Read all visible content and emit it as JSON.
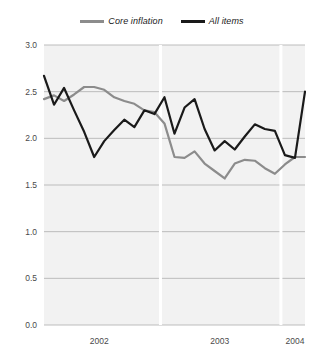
{
  "chart_data": {
    "type": "line",
    "title": "",
    "xlabel": "",
    "ylabel": "",
    "ylim": [
      0.0,
      3.0
    ],
    "ytick_labels": [
      "0.0",
      "0.5",
      "1.0",
      "1.5",
      "2.0",
      "2.5",
      "3.0"
    ],
    "yticks": [
      0.0,
      0.5,
      1.0,
      1.5,
      2.0,
      2.5,
      3.0
    ],
    "xtick_labels": [
      "2002",
      "2003",
      "2004"
    ],
    "xticks": [
      2002,
      2003,
      2004
    ],
    "grid": true,
    "legend_position": "top-center",
    "x": [
      "2002-01",
      "2002-02",
      "2002-03",
      "2002-04",
      "2002-05",
      "2002-06",
      "2002-07",
      "2002-08",
      "2002-09",
      "2002-10",
      "2002-11",
      "2002-12",
      "2003-01",
      "2003-02",
      "2003-03",
      "2003-04",
      "2003-05",
      "2003-06",
      "2003-07",
      "2003-08",
      "2003-09",
      "2003-10",
      "2003-11",
      "2003-12",
      "2004-01",
      "2004-02",
      "2004-03"
    ],
    "series": [
      {
        "name": "Core inflation",
        "color": "#8c8c8c",
        "values": [
          2.42,
          2.46,
          2.4,
          2.47,
          2.55,
          2.55,
          2.52,
          2.44,
          2.4,
          2.37,
          2.3,
          2.28,
          2.16,
          1.8,
          1.79,
          1.86,
          1.73,
          1.65,
          1.57,
          1.73,
          1.77,
          1.76,
          1.68,
          1.62,
          1.72,
          1.8,
          1.8
        ]
      },
      {
        "name": "All items",
        "color": "#1a1a1a",
        "values": [
          2.67,
          2.36,
          2.54,
          2.3,
          2.07,
          1.8,
          1.97,
          2.09,
          2.2,
          2.12,
          2.3,
          2.26,
          2.44,
          2.05,
          2.33,
          2.42,
          2.1,
          1.87,
          1.97,
          1.88,
          2.02,
          2.15,
          2.1,
          2.08,
          1.82,
          1.79,
          2.5
        ]
      }
    ]
  }
}
